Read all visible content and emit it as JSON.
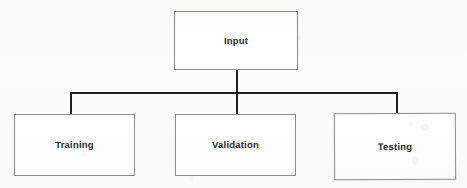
{
  "diagram": {
    "type": "flowchart-tree",
    "colors": {
      "background": "#fcfcfb",
      "node_fill": "#ffffff",
      "node_border": "#8c8c8c",
      "edge": "#1e1e1e",
      "text": "#2a2a2a"
    },
    "nodes": [
      {
        "id": "input",
        "label": "Input",
        "role": "root",
        "x": 174,
        "y": 11,
        "width": 124,
        "height": 59
      },
      {
        "id": "training",
        "label": "Training",
        "role": "child",
        "x": 14,
        "y": 114,
        "width": 121,
        "height": 62
      },
      {
        "id": "validation",
        "label": "Validation",
        "role": "child",
        "x": 175,
        "y": 114,
        "width": 121,
        "height": 62
      },
      {
        "id": "testing",
        "label": "Testing",
        "role": "child",
        "x": 334,
        "y": 113,
        "width": 122,
        "height": 67
      }
    ],
    "edges": [
      {
        "id": "input-to-bus",
        "from": "input",
        "to": "bus",
        "orientation": "vertical"
      },
      {
        "id": "bus",
        "from": "bus",
        "to": "bus",
        "orientation": "horizontal"
      },
      {
        "id": "bus-to-training",
        "from": "bus",
        "to": "training",
        "orientation": "vertical"
      },
      {
        "id": "bus-to-validation",
        "from": "bus",
        "to": "validation",
        "orientation": "vertical"
      },
      {
        "id": "bus-to-testing",
        "from": "bus",
        "to": "testing",
        "orientation": "vertical"
      }
    ]
  }
}
